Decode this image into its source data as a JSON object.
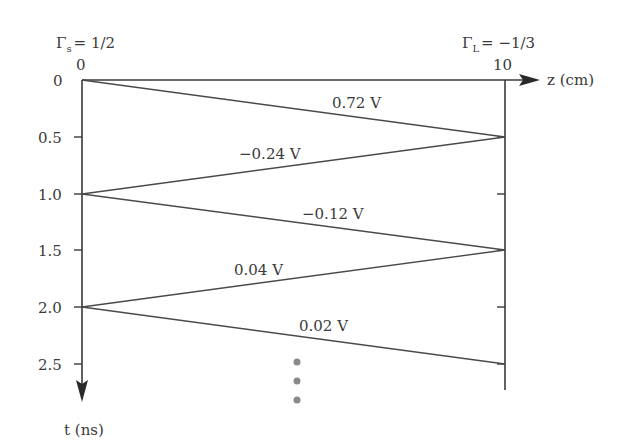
{
  "diagram": {
    "type": "bounce-diagram",
    "source_reflection": {
      "symbol": "Γ",
      "subscript": "s",
      "value": "= 1/2"
    },
    "load_reflection": {
      "symbol": "Γ",
      "subscript": "L",
      "value": "= −1/3"
    },
    "z_axis": {
      "label": "z (cm)",
      "start_label": "0",
      "end_label": "10"
    },
    "t_axis": {
      "label": "t (ns)",
      "ticks": [
        "0",
        "0.5",
        "1.0",
        "1.5",
        "2.0",
        "2.5"
      ]
    },
    "waves": [
      {
        "label": "0.72 V",
        "from": {
          "z": 0,
          "t": 0
        },
        "to": {
          "z": 10,
          "t": 0.5
        }
      },
      {
        "label": "−0.24 V",
        "from": {
          "z": 10,
          "t": 0.5
        },
        "to": {
          "z": 0,
          "t": 1.0
        }
      },
      {
        "label": "−0.12 V",
        "from": {
          "z": 0,
          "t": 1.0
        },
        "to": {
          "z": 10,
          "t": 1.5
        }
      },
      {
        "label": "0.04 V",
        "from": {
          "z": 10,
          "t": 1.5
        },
        "to": {
          "z": 0,
          "t": 2.0
        }
      },
      {
        "label": "0.02 V",
        "from": {
          "z": 0,
          "t": 2.0
        },
        "to": {
          "z": 10,
          "t": 2.5
        }
      }
    ],
    "continuation": "⋮",
    "colors": {
      "line": "#4a4a4a",
      "text": "#3a3a3a",
      "dots": "#8a8a8a"
    }
  }
}
